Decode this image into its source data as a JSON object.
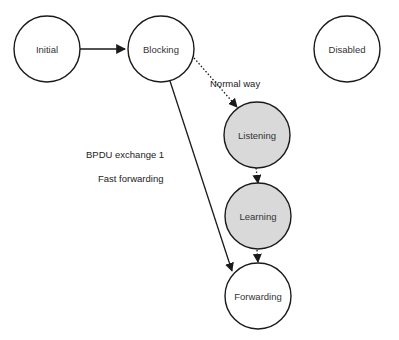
{
  "diagram": {
    "colors": {
      "stroke": "#1a1a1a",
      "plain_fill": "#ffffff",
      "highlight_fill": "#d9d9d9",
      "text": "#333333"
    },
    "states": [
      {
        "id": "initial",
        "label": "Initial",
        "highlighted": false
      },
      {
        "id": "blocking",
        "label": "Blocking",
        "highlighted": false
      },
      {
        "id": "disabled",
        "label": "Disabled",
        "highlighted": false
      },
      {
        "id": "listening",
        "label": "Listening",
        "highlighted": true
      },
      {
        "id": "learning",
        "label": "Learning",
        "highlighted": true
      },
      {
        "id": "forwarding",
        "label": "Forwarding",
        "highlighted": false
      }
    ],
    "transitions": [
      {
        "from": "initial",
        "to": "blocking",
        "style": "solid",
        "label": ""
      },
      {
        "from": "blocking",
        "to": "listening",
        "style": "dotted",
        "label": "Normal way"
      },
      {
        "from": "listening",
        "to": "learning",
        "style": "dotted",
        "label": ""
      },
      {
        "from": "learning",
        "to": "forwarding",
        "style": "dotted",
        "label": ""
      },
      {
        "from": "blocking",
        "to": "forwarding",
        "style": "solid",
        "label": "BPDU exchange 1"
      }
    ],
    "edge_labels": {
      "normal_way": "Normal way",
      "bpdu_exchange": "BPDU exchange 1",
      "fast_forwarding": "Fast forwarding"
    }
  }
}
